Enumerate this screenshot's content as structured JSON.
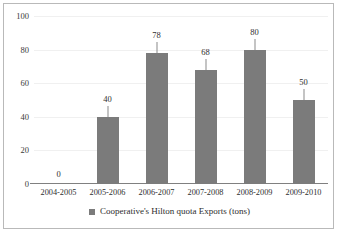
{
  "chart_data": {
    "type": "bar",
    "title": "",
    "subtitle": "",
    "xlabel": "",
    "ylabel": "",
    "categories": [
      "2004-2005",
      "2005-2006",
      "2006-2007",
      "2007-2008",
      "2008-2009",
      "2009-2010"
    ],
    "values": [
      0,
      40,
      78,
      68,
      80,
      50
    ],
    "data_labels": [
      "0",
      "40",
      "78",
      "68",
      "80",
      "50"
    ],
    "series": [
      {
        "name": "Cooperative's Hilton quota Exports (tons)",
        "values": [
          0,
          40,
          78,
          68,
          80,
          50
        ]
      }
    ],
    "ylim": [
      0,
      100
    ],
    "y_ticks": [
      0,
      20,
      40,
      60,
      80,
      100
    ],
    "y_tick_labels": [
      "0",
      "20",
      "40",
      "60",
      "80",
      "100"
    ],
    "grid": true,
    "legend_position": "bottom",
    "legend_entries": [
      "Cooperative's Hilton quota Exports (tons)"
    ],
    "colors": {
      "bar": "#7b7b7b",
      "axis": "#808080",
      "gridline": "#f0f0f0",
      "frame": "#b9b9b9",
      "text": "#2e2e2e",
      "background": "#ffffff"
    }
  },
  "legend": {
    "label": "Cooperative's Hilton quota Exports (tons)"
  }
}
